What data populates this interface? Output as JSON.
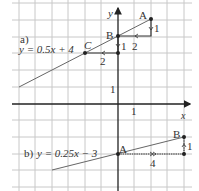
{
  "diagram": {
    "type": "coordinate-grid-linear-functions",
    "axes": {
      "x_label": "x",
      "y_label": "y",
      "unit_label_x": "1",
      "unit_label_y": "1"
    },
    "part_a": {
      "label": "a)",
      "equation": "y = 0.5x + 4",
      "points": {
        "A": "A",
        "B": "B",
        "C": "C"
      },
      "step_labels": {
        "run_AB": "2",
        "rise_AB": "1",
        "run_BC": "2",
        "rise_BC": "1"
      }
    },
    "part_b": {
      "label": "b)",
      "equation": "y = 0.25x − 3",
      "points": {
        "A": "A",
        "B": "B"
      },
      "step_labels": {
        "run": "4",
        "rise": "1"
      }
    },
    "colors": {
      "grid": "#c8c8c8",
      "axis": "#222222",
      "line": "#555555",
      "text": "#333333"
    }
  }
}
